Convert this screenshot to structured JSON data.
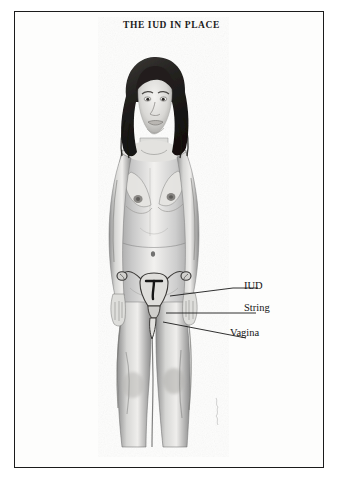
{
  "plate": {
    "title": "THE IUD IN PLACE",
    "medium": "pencil illustration",
    "frame_color": "#1b1b1b",
    "paper_color": "#fdfdfc",
    "ink_color": "#151515"
  },
  "subject": {
    "description": "standing nude female figure, front view, arms at sides, shoulder-length wavy dark hair, cropped at mid-calf",
    "signature": "artist signature"
  },
  "anatomy_overlay": {
    "description": "cut-away of the uterus, fallopian tubes, ovaries, cervix and vagina superimposed over the pelvis",
    "parts": [
      "uterus",
      "fallopian-tube-left",
      "fallopian-tube-right",
      "ovary-left",
      "ovary-right",
      "iud-device",
      "cervix",
      "vaginal-canal"
    ]
  },
  "labels": [
    {
      "id": "iud",
      "text": "IUD"
    },
    {
      "id": "string",
      "text": "String"
    },
    {
      "id": "vagina",
      "text": "Vagina"
    }
  ]
}
